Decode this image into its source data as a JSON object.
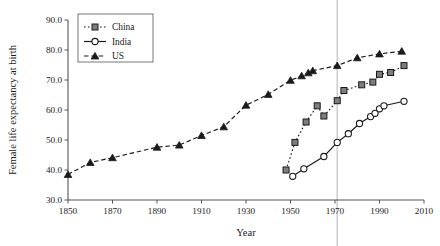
{
  "chart_data": {
    "type": "line",
    "title": "",
    "xlabel": "Year",
    "ylabel": "Female life expectancy at birth",
    "xlim": [
      1850,
      2010
    ],
    "ylim": [
      30.0,
      90.0
    ],
    "xticks": [
      1850,
      1870,
      1890,
      1910,
      1930,
      1950,
      1970,
      1990,
      2010
    ],
    "xtick_labels": [
      "1850",
      "1870",
      "1890",
      "1910",
      "1930",
      "1950",
      "1970",
      "1990",
      "2010"
    ],
    "yticks": [
      30.0,
      40.0,
      50.0,
      60.0,
      70.0,
      80.0,
      90.0
    ],
    "ytick_labels": [
      "30.0",
      "40.0",
      "50.0",
      "60.0",
      "70.0",
      "80.0",
      "90.0"
    ],
    "grid": false,
    "legend_position": "top-left",
    "annotations": [
      {
        "name": "reference-line-1971",
        "type": "vline",
        "x": 1971,
        "color": "#d0d0d0"
      }
    ],
    "series": [
      {
        "name": "China",
        "marker": "square",
        "marker_fill": "#7d7d7d",
        "line_style": "dotted",
        "color": "#1a1a1a",
        "points": [
          {
            "x": 1948,
            "y": 40.0
          },
          {
            "x": 1952,
            "y": 49.2
          },
          {
            "x": 1957,
            "y": 56.0
          },
          {
            "x": 1962,
            "y": 61.4
          },
          {
            "x": 1965,
            "y": 58.0
          },
          {
            "x": 1971,
            "y": 63.1
          },
          {
            "x": 1974,
            "y": 66.5
          },
          {
            "x": 1982,
            "y": 68.4
          },
          {
            "x": 1987,
            "y": 69.3
          },
          {
            "x": 1990,
            "y": 71.9
          },
          {
            "x": 1995,
            "y": 72.5
          },
          {
            "x": 2001,
            "y": 74.8
          }
        ]
      },
      {
        "name": "India",
        "marker": "circle",
        "marker_fill": "#ffffff",
        "line_style": "solid",
        "color": "#1a1a1a",
        "points": [
          {
            "x": 1951,
            "y": 37.9
          },
          {
            "x": 1956,
            "y": 40.4
          },
          {
            "x": 1965,
            "y": 44.5
          },
          {
            "x": 1971,
            "y": 49.2
          },
          {
            "x": 1976,
            "y": 52.1
          },
          {
            "x": 1981,
            "y": 55.5
          },
          {
            "x": 1986,
            "y": 57.8
          },
          {
            "x": 1988,
            "y": 58.9
          },
          {
            "x": 1990,
            "y": 60.4
          },
          {
            "x": 1992,
            "y": 61.4
          },
          {
            "x": 2001,
            "y": 62.9
          }
        ]
      },
      {
        "name": "US",
        "marker": "triangle",
        "marker_fill": "#1a1a1a",
        "line_style": "dashed",
        "color": "#1a1a1a",
        "points": [
          {
            "x": 1850,
            "y": 38.5
          },
          {
            "x": 1860,
            "y": 42.5
          },
          {
            "x": 1870,
            "y": 44.1
          },
          {
            "x": 1890,
            "y": 47.6
          },
          {
            "x": 1900,
            "y": 48.3
          },
          {
            "x": 1910,
            "y": 51.5
          },
          {
            "x": 1920,
            "y": 54.4
          },
          {
            "x": 1930,
            "y": 61.6
          },
          {
            "x": 1940,
            "y": 65.2
          },
          {
            "x": 1950,
            "y": 69.9
          },
          {
            "x": 1955,
            "y": 71.4
          },
          {
            "x": 1958,
            "y": 72.4
          },
          {
            "x": 1960,
            "y": 73.1
          },
          {
            "x": 1971,
            "y": 74.8
          },
          {
            "x": 1980,
            "y": 77.4
          },
          {
            "x": 1990,
            "y": 78.7
          },
          {
            "x": 2000,
            "y": 79.6
          }
        ]
      }
    ]
  },
  "legend": {
    "items": [
      {
        "label": "China"
      },
      {
        "label": "India"
      },
      {
        "label": "US"
      }
    ]
  }
}
